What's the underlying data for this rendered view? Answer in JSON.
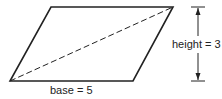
{
  "diagram": {
    "shape": "parallelogram",
    "vertices": [
      [
        51,
        7
      ],
      [
        173,
        7
      ],
      [
        133,
        81
      ],
      [
        10,
        81
      ]
    ],
    "diagonal": {
      "from": [
        10,
        81
      ],
      "to": [
        173,
        7
      ],
      "style": "dashed"
    },
    "labels": {
      "base": "base = 5",
      "height": "height = 3"
    },
    "stroke_color": "#222222"
  }
}
